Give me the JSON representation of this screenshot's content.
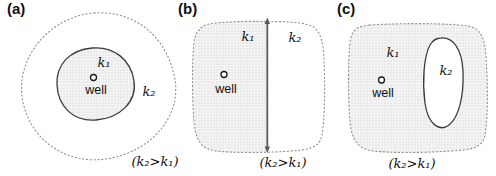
{
  "panels": [
    {
      "tag": "(a)",
      "k1_label": "k₁",
      "k2_label": "k₂",
      "well_label": "well",
      "condition": "(k₂>k₁)"
    },
    {
      "tag": "(b)",
      "k1_label": "k₁",
      "k2_label": "k₂",
      "well_label": "well",
      "condition": "(k₂>k₁)"
    },
    {
      "tag": "(c)",
      "k1_label": "k₁",
      "k2_label": "k₂",
      "well_label": "well",
      "condition": "(k₂>k₁)"
    }
  ],
  "colors": {
    "stipple_dot": "#c0c0c0",
    "stipple_bg": "#f5f5f5",
    "dashed_boundary": "#8f8f8f",
    "solid_boundary": "#3d3d3d",
    "interface_line": "#5a5a5a",
    "text": "#111111"
  }
}
